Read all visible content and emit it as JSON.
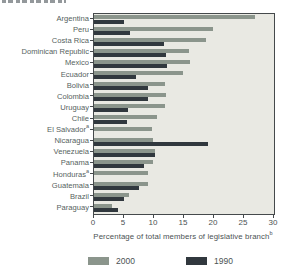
{
  "accent_colors": {
    "series_2000": "#8b958c",
    "series_1990": "#31383e",
    "plot_background": "#e9e9e3",
    "frame": "#45494b",
    "text": "#4b5253"
  },
  "chart_data": {
    "type": "bar",
    "orientation": "horizontal",
    "title": "",
    "xlabel": {
      "text": "Percentage of total members of legislative branch",
      "footnote": "b"
    },
    "ylabel": "",
    "xlim": [
      0,
      30
    ],
    "xticks": [
      0,
      5,
      10,
      15,
      20,
      25,
      30
    ],
    "grid": false,
    "legend_position": "bottom",
    "categories": [
      {
        "label": "Argentina",
        "footnote": ""
      },
      {
        "label": "Peru",
        "footnote": ""
      },
      {
        "label": "Costa Rica",
        "footnote": ""
      },
      {
        "label": "Dominican Republic",
        "footnote": ""
      },
      {
        "label": "Mexico",
        "footnote": ""
      },
      {
        "label": "Ecuador",
        "footnote": ""
      },
      {
        "label": "Bolivia",
        "footnote": ""
      },
      {
        "label": "Colombia",
        "footnote": ""
      },
      {
        "label": "Uruguay",
        "footnote": ""
      },
      {
        "label": "Chile",
        "footnote": ""
      },
      {
        "label": "El Salvador",
        "footnote": "a"
      },
      {
        "label": "Nicaragua",
        "footnote": ""
      },
      {
        "label": "Venezuela",
        "footnote": ""
      },
      {
        "label": "Panama",
        "footnote": ""
      },
      {
        "label": "Honduras",
        "footnote": "a"
      },
      {
        "label": "Guatemala",
        "footnote": ""
      },
      {
        "label": "Brazil",
        "footnote": ""
      },
      {
        "label": "Paraguay",
        "footnote": ""
      }
    ],
    "series": [
      {
        "name": "2000",
        "color": "#8b958c",
        "values": [
          26.8,
          19.8,
          18.7,
          15.9,
          16.0,
          14.8,
          11.8,
          12.0,
          11.9,
          10.5,
          9.7,
          9.8,
          10.2,
          9.9,
          9.0,
          9.0,
          5.8,
          3.0
        ]
      },
      {
        "name": "1990",
        "color": "#31383e",
        "values": [
          5.0,
          6.0,
          11.7,
          12.0,
          12.2,
          7.0,
          9.0,
          9.0,
          5.7,
          5.5,
          null,
          19.0,
          10.2,
          8.4,
          null,
          7.5,
          5.0,
          4.0
        ]
      }
    ]
  }
}
